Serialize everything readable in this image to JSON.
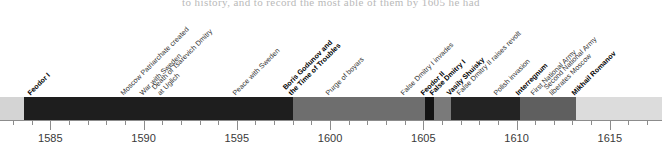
{
  "clipped_text": "to history, and to record the most able of them by 1605 he had",
  "chart_data": {
    "type": "timeline",
    "title": "",
    "xlabel": "",
    "ylabel": "",
    "xlim": [
      1582.3,
      1617.8
    ],
    "axis": {
      "major_ticks": [
        1585,
        1590,
        1595,
        1600,
        1605,
        1610,
        1615
      ],
      "major_tick_labels": [
        "1585",
        "1590",
        "1595",
        "1600",
        "1605",
        "1610",
        "1615"
      ],
      "minor_tick_step": 1,
      "grid": false,
      "legend": "none"
    },
    "segments": [
      {
        "name": "pre-reign",
        "start": 1582.3,
        "end": 1583.6,
        "color": "#d4d4d4"
      },
      {
        "name": "Feodor I",
        "start": 1583.6,
        "end": 1598.0,
        "color": "#1e1e1e"
      },
      {
        "name": "Boris Godunov",
        "start": 1598.0,
        "end": 1605.1,
        "color": "#6e6e6e"
      },
      {
        "name": "Feodor II",
        "start": 1605.1,
        "end": 1605.6,
        "color": "#141414"
      },
      {
        "name": "False Dmitry I",
        "start": 1605.6,
        "end": 1606.5,
        "color": "#7a7a7a"
      },
      {
        "name": "Vasily Shuisky",
        "start": 1606.5,
        "end": 1610.2,
        "color": "#232323"
      },
      {
        "name": "Interregnum",
        "start": 1610.2,
        "end": 1613.2,
        "color": "#5f5f5f"
      },
      {
        "name": "Mikhail Romanov",
        "start": 1613.2,
        "end": 1617.8,
        "color": "#dcdcdc"
      }
    ],
    "events": [
      {
        "label": "Feodor I",
        "year": 1584.0,
        "type": "ruler",
        "bold": true
      },
      {
        "label": "Moscow Patriarchate created",
        "year": 1589.0,
        "type": "event",
        "bold": false
      },
      {
        "label": "War with Sweden",
        "year": 1590.0,
        "type": "event",
        "bold": false
      },
      {
        "label": "Death of Tsarevich Dmitry",
        "label2": "at Uglich",
        "year": 1591.0,
        "type": "event",
        "bold": false
      },
      {
        "label": "Peace with Sweden",
        "year": 1595.0,
        "type": "event",
        "bold": false
      },
      {
        "label": "Boris Godunov and",
        "label2": "the Time of Troubles",
        "year": 1598.0,
        "type": "ruler",
        "bold": true
      },
      {
        "label": "Purge of boyars",
        "year": 1600.0,
        "type": "event",
        "bold": false
      },
      {
        "label": "False Dmitry I invades",
        "year": 1604.0,
        "type": "event",
        "bold": false
      },
      {
        "label": "Feodor II",
        "year": 1605.1,
        "type": "ruler",
        "bold": true
      },
      {
        "label": "False Dmitry I",
        "year": 1605.6,
        "type": "ruler",
        "bold": true
      },
      {
        "label": "Vasily Shuisky",
        "year": 1606.5,
        "type": "ruler",
        "bold": true
      },
      {
        "label": "False Dmitry II raises revolt",
        "year": 1607.0,
        "type": "event",
        "bold": false
      },
      {
        "label": "Polish invasion",
        "year": 1609.0,
        "type": "event",
        "bold": false
      },
      {
        "label": "Interregnum",
        "year": 1610.2,
        "type": "ruler",
        "bold": true
      },
      {
        "label": "First National Army",
        "year": 1611.0,
        "type": "event",
        "bold": false
      },
      {
        "label": "Second National Army",
        "label2": "liberates Moscow",
        "year": 1612.0,
        "type": "event",
        "bold": false
      },
      {
        "label": "Mikhail Romanov",
        "year": 1613.2,
        "type": "ruler",
        "bold": true
      }
    ]
  }
}
